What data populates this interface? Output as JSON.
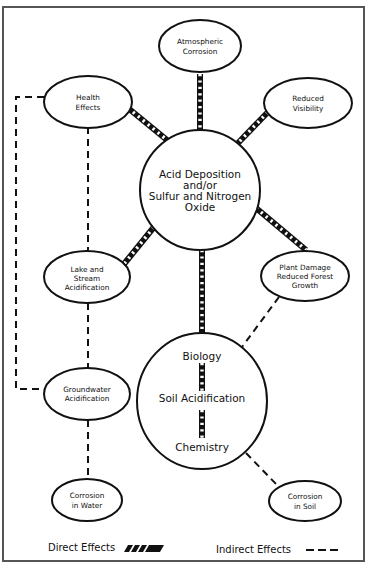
{
  "diagram": {
    "center_node": {
      "lines": [
        "Acid Deposition",
        "and/or",
        "Sulfur and Nitrogen",
        "Oxide"
      ]
    },
    "soil_node": {
      "top": "Biology",
      "middle": "Soil Acidification",
      "bottom": "Chemistry"
    },
    "nodes": {
      "atmospheric_corrosion": [
        "Atmospheric",
        "Corrosion"
      ],
      "health_effects": [
        "Health",
        "Effects"
      ],
      "reduced_visibility": [
        "Reduced",
        "Visibility"
      ],
      "lake_stream": [
        "Lake and",
        "Stream",
        "Acidification"
      ],
      "plant_damage": [
        "Plant Damage",
        "Reduced Forest",
        "Growth"
      ],
      "groundwater": [
        "Groundwater",
        "Acidification"
      ],
      "corrosion_water": [
        "Corrosion",
        "in Water"
      ],
      "corrosion_soil": [
        "Corrosion",
        "in Soil"
      ]
    },
    "edges": {
      "direct": [
        [
          "acid_deposition",
          "atmospheric_corrosion"
        ],
        [
          "acid_deposition",
          "health_effects"
        ],
        [
          "acid_deposition",
          "reduced_visibility"
        ],
        [
          "acid_deposition",
          "lake_stream"
        ],
        [
          "acid_deposition",
          "plant_damage"
        ],
        [
          "acid_deposition",
          "soil_acidification"
        ],
        [
          "biology",
          "soil_acidification"
        ],
        [
          "soil_acidification",
          "chemistry"
        ]
      ],
      "indirect": [
        [
          "health_effects",
          "lake_stream"
        ],
        [
          "health_effects",
          "groundwater"
        ],
        [
          "lake_stream",
          "groundwater"
        ],
        [
          "groundwater",
          "corrosion_water"
        ],
        [
          "plant_damage",
          "soil_acidification"
        ],
        [
          "soil_acidification",
          "corrosion_soil"
        ]
      ]
    }
  },
  "legend": {
    "direct_label": "Direct Effects",
    "indirect_label": "Indirect Effects"
  }
}
